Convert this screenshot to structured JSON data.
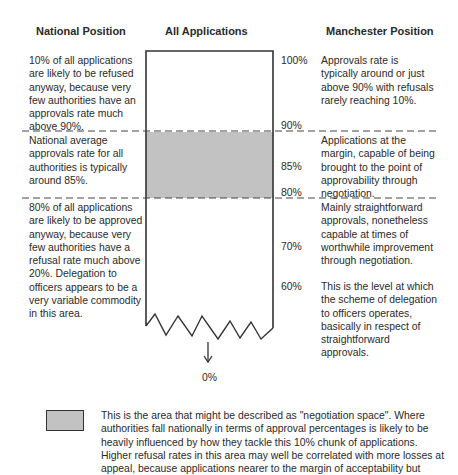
{
  "headers": {
    "national": "National Position",
    "all": "All Applications",
    "manchester": "Manchester Position"
  },
  "national": {
    "top": "10% of all applications are likely to be refused anyway, because very few authorities have an approvals rate much above 90%.",
    "middle": "National average approvals rate for all authorities is typically around 85%.",
    "bottom": "80% of all applications are likely to be approved anyway, because very few authorities have a refusal rate much above 20%. Delegation to officers appears to be a very variable commodity in this area."
  },
  "manchester": {
    "top": "Approvals rate is typically around or just above 90% with refusals rarely reaching 10%.",
    "middle": "Applications at the margin, capable of being brought to the point of approvability through negotiation.",
    "lower1": "Mainly straightforward approvals, nonetheless capable at times of worthwhile improvement through negotiation.",
    "lower2": "This is the level at which the scheme of delegation to officers operates, basically in respect of straightforward approvals."
  },
  "percent_labels": {
    "p100": "100%",
    "p90": "90%",
    "p85": "85%",
    "p80": "80%",
    "p70": "70%",
    "p60": "60%",
    "p0": "0%"
  },
  "legend": {
    "text": "This is the area that might be described as \"negotiation space\". Where authorities fall nationally in terms of approval percentages is likely to be heavily influenced by how they tackle this 10% chunk of applications. Higher refusal rates in this area may well be correlated with more losses at appeal, because applications nearer to the margin of acceptability but"
  },
  "colors": {
    "negotiation_band": "#c2c2c2",
    "lines": "#333333"
  }
}
